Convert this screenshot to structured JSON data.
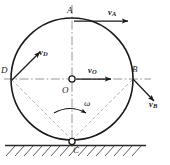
{
  "figure": {
    "type": "mechanics-diagram",
    "geometry": {
      "circle": {
        "cx": 72,
        "cy": 79,
        "r": 61
      },
      "ground_y": 145,
      "ground_x_start": 5,
      "ground_x_end": 146
    },
    "points": [
      {
        "id": "A",
        "label": "A",
        "x": 72,
        "y": 18,
        "marker": "none"
      },
      {
        "id": "D",
        "label": "D",
        "x": 11,
        "y": 79,
        "marker": "none"
      },
      {
        "id": "B",
        "label": "B",
        "x": 133,
        "y": 79,
        "marker": "none"
      },
      {
        "id": "C",
        "label": "C",
        "x": 72,
        "y": 140,
        "marker": "open-circle"
      },
      {
        "id": "O",
        "label": "O",
        "x": 72,
        "y": 79,
        "marker": "open-circle"
      }
    ],
    "vectors": [
      {
        "id": "vA",
        "symbol": "v",
        "subscript": "A",
        "from": "A",
        "direction": "right"
      },
      {
        "id": "vO",
        "symbol": "v",
        "subscript": "O",
        "from": "O",
        "direction": "right"
      },
      {
        "id": "vD",
        "symbol": "v",
        "subscript": "D",
        "from": "D",
        "direction": "up-right"
      },
      {
        "id": "vB",
        "symbol": "v",
        "subscript": "B",
        "from": "B",
        "direction": "down-right"
      }
    ],
    "angular_velocity": {
      "symbol": "ω",
      "sense": "clockwise"
    },
    "labels": {
      "A": "A",
      "B": "B",
      "C": "C",
      "D": "D",
      "O": "O",
      "v": "v",
      "vA_sub": "A",
      "vO_sub": "O",
      "vD_sub": "D",
      "vB_sub": "B",
      "omega": "ω"
    },
    "colors": {
      "stroke": "#1a1a1a",
      "axis": "#7a7a7a",
      "dashed": "#9a9a9a",
      "ground": "#3a3a3a",
      "background": "#ffffff"
    }
  }
}
